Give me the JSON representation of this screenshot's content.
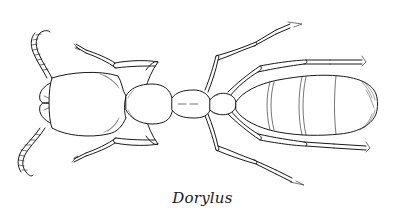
{
  "figure": {
    "caption": "Dorylus",
    "colors": {
      "background": "#ffffff",
      "ink": "#1a1a1a"
    }
  }
}
